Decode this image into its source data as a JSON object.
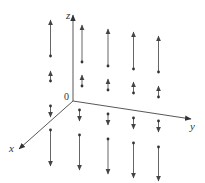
{
  "diagram": {
    "type": "3d-vector-field",
    "axes": {
      "x_label": "x",
      "y_label": "y",
      "z_label": "z",
      "origin_label": "0"
    },
    "colors": {
      "axis": "#444444",
      "arrow": "#555555",
      "dot": "#333333"
    },
    "origin": [
      73,
      101
    ],
    "axis_ends": {
      "z": [
        73,
        15
      ],
      "y": [
        191,
        119
      ],
      "x": [
        19,
        149
      ]
    },
    "label_positions": {
      "z": [
        66,
        19
      ],
      "y": [
        190,
        130
      ],
      "x": [
        9,
        152
      ],
      "origin": [
        64,
        100
      ]
    },
    "arrows": [
      {
        "x": 50.5,
        "y0": 56,
        "y1": 20
      },
      {
        "x": 82,
        "y0": 62,
        "y1": 25
      },
      {
        "x": 108,
        "y0": 66,
        "y1": 29
      },
      {
        "x": 133.5,
        "y0": 69,
        "y1": 32
      },
      {
        "x": 158.5,
        "y0": 72,
        "y1": 36
      },
      {
        "x": 50.5,
        "y0": 81,
        "y1": 71
      },
      {
        "x": 82,
        "y0": 86,
        "y1": 75
      },
      {
        "x": 108,
        "y0": 90,
        "y1": 79
      },
      {
        "x": 133.5,
        "y0": 93,
        "y1": 82
      },
      {
        "x": 158.5,
        "y0": 97,
        "y1": 86
      },
      {
        "x": 50.5,
        "y0": 106,
        "y1": 117
      },
      {
        "x": 79.5,
        "y0": 110,
        "y1": 121
      },
      {
        "x": 108,
        "y0": 114,
        "y1": 125
      },
      {
        "x": 133.5,
        "y0": 118,
        "y1": 129
      },
      {
        "x": 158.5,
        "y0": 121,
        "y1": 132
      },
      {
        "x": 50.5,
        "y0": 130,
        "y1": 166
      },
      {
        "x": 79.5,
        "y0": 135,
        "y1": 170
      },
      {
        "x": 108,
        "y0": 139,
        "y1": 174
      },
      {
        "x": 133.5,
        "y0": 143,
        "y1": 178
      },
      {
        "x": 158.5,
        "y0": 147,
        "y1": 181
      }
    ]
  }
}
